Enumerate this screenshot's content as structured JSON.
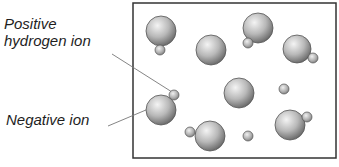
{
  "labels": {
    "positive_line1": "Positive",
    "positive_line2": "hydrogen ion",
    "negative": "Negative ion"
  },
  "container": {
    "x": 133,
    "y": 3,
    "width": 203,
    "height": 155,
    "stroke": "#333333"
  },
  "colors": {
    "ion_light": "#f2f2f2",
    "ion_mid": "#b4b4b4",
    "ion_dark": "#6e6e6e",
    "outline": "#555555",
    "leader": "#777777"
  },
  "negative_ions": [
    {
      "cx": 161,
      "cy": 31,
      "r": 15
    },
    {
      "cx": 211,
      "cy": 50,
      "r": 15
    },
    {
      "cx": 258,
      "cy": 28,
      "r": 15
    },
    {
      "cx": 297,
      "cy": 49,
      "r": 14
    },
    {
      "cx": 239,
      "cy": 93,
      "r": 15
    },
    {
      "cx": 161,
      "cy": 110,
      "r": 15
    },
    {
      "cx": 210,
      "cy": 136,
      "r": 15
    },
    {
      "cx": 290,
      "cy": 125,
      "r": 15
    }
  ],
  "hydrogen_ions": [
    {
      "cx": 160,
      "cy": 50,
      "r": 5
    },
    {
      "cx": 248,
      "cy": 43,
      "r": 5
    },
    {
      "cx": 313,
      "cy": 58,
      "r": 5
    },
    {
      "cx": 174,
      "cy": 95,
      "r": 5
    },
    {
      "cx": 284,
      "cy": 89,
      "r": 5
    },
    {
      "cx": 190,
      "cy": 132,
      "r": 5
    },
    {
      "cx": 248,
      "cy": 136,
      "r": 5
    },
    {
      "cx": 307,
      "cy": 117,
      "r": 5
    }
  ],
  "leaders": [
    {
      "name": "positive-leader",
      "x1": 112,
      "y1": 54,
      "x2": 172,
      "y2": 92
    },
    {
      "name": "negative-leader",
      "x1": 108,
      "y1": 126,
      "x2": 153,
      "y2": 107
    }
  ]
}
